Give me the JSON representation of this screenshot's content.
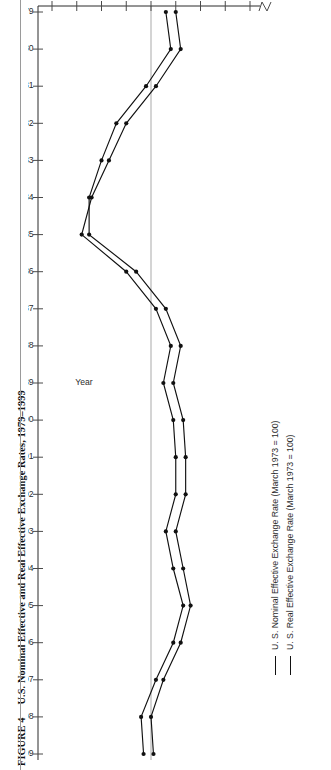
{
  "figure": {
    "number": "FIGURE 4",
    "title": "U.S. Nominal Effective and Real Effective Exchange Rates, 1979–1999"
  },
  "legend": {
    "items": [
      {
        "label": "U. S. Nominal Effective Exchange Rate (March 1973 = 100)",
        "color": "#111111"
      },
      {
        "label": "U. S. Real Effective Exchange Rate (March 1973 = 100)",
        "color": "#111111"
      }
    ]
  },
  "chart_data": {
    "type": "line",
    "title": "U.S. Nominal Effective and Real Effective Exchange Rates, 1979–1999",
    "orientation": "rotated-90ccw",
    "xlabel": "Year",
    "ylabel": "",
    "xlim": [
      1979,
      1999
    ],
    "ylim": [
      60,
      140
    ],
    "yticks": [
      140,
      130,
      120,
      110,
      100,
      90,
      80,
      70,
      60
    ],
    "axis_break_after": 60,
    "grid": false,
    "reference_line": {
      "value": 100,
      "color": "#b8b8b8"
    },
    "legend_position": "bottom-right",
    "x": [
      1979,
      1980,
      1981,
      1982,
      1983,
      1984,
      1985,
      1986,
      1987,
      1988,
      1989,
      1990,
      1991,
      1992,
      1993,
      1994,
      1995,
      1996,
      1997,
      1998,
      1999
    ],
    "categories": [
      "1979",
      "1980",
      "1981",
      "1982",
      "1983",
      "1984",
      "1985",
      "1986",
      "1987",
      "1988",
      "1989",
      "1990",
      "1991",
      "1992",
      "1993",
      "1994",
      "1995",
      "1996",
      "1997",
      "1998",
      "1999"
    ],
    "series": [
      {
        "name": "U. S. Nominal Effective Exchange Rate (March 1973 = 100)",
        "color": "#111111",
        "values": [
          90,
          88,
          98,
          110,
          117,
          124,
          128,
          110,
          98,
          92,
          95,
          91,
          90,
          90,
          94,
          91,
          87,
          91,
          98,
          104,
          103
        ]
      },
      {
        "name": "U. S. Real Effective Exchange Rate (March 1973 = 100)",
        "color": "#111111",
        "values": [
          94,
          92,
          102,
          114,
          120,
          125,
          125,
          106,
          94,
          88,
          91,
          87,
          86,
          86,
          90,
          87,
          84,
          88,
          95,
          100,
          99
        ]
      }
    ]
  }
}
